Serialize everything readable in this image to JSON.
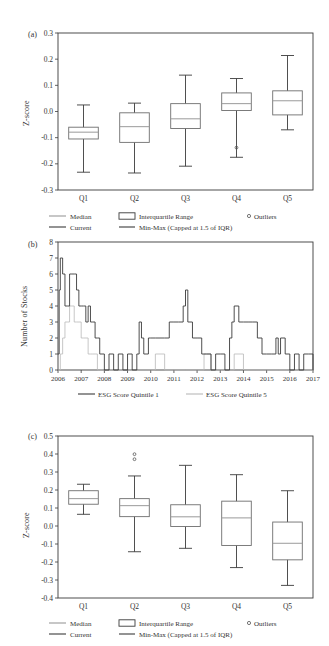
{
  "figure": {
    "panels": [
      "(a)",
      "(b)",
      "(c)"
    ]
  },
  "panel_a": {
    "label": "(a)",
    "ylabel": "Z-score",
    "yticks": [
      "0.3",
      "0.2",
      "0.1",
      "0.0",
      "-0.1",
      "-0.2",
      "-0.3"
    ],
    "xticks": [
      "Q1",
      "Q2",
      "Q3",
      "Q4",
      "Q5"
    ]
  },
  "panel_b": {
    "label": "(b)",
    "ylabel": "Number of Stocks",
    "yticks": [
      "8",
      "7",
      "6",
      "5",
      "4",
      "3",
      "2",
      "1",
      "0"
    ],
    "xticks": [
      "2006",
      "2007",
      "2008",
      "2009",
      "2010",
      "2011",
      "2012",
      "2013",
      "2014",
      "2015",
      "2016",
      "2017"
    ]
  },
  "panel_c": {
    "label": "(c)",
    "ylabel": "Z-score",
    "yticks": [
      "0.5",
      "0.4",
      "0.3",
      "0.2",
      "0.1",
      "0.0",
      "-0.1",
      "-0.2",
      "-0.3",
      "-0.4"
    ],
    "xticks": [
      "Q1",
      "Q2",
      "Q3",
      "Q4",
      "Q5"
    ]
  },
  "box_legend": {
    "median": "Median",
    "iqr": "Interquartile Range",
    "outliers": "Outliers",
    "current": "Current",
    "minmax": "Min-Max (Capped at 1.5 of IQR)"
  },
  "line_legend": {
    "series1": "ESG Score Quintile 1",
    "series2": "ESG Score Quintile 5"
  },
  "colors": {
    "median": "#9a9a9a",
    "current": "#3b3b3b",
    "box": "#6e6e6e",
    "whisker": "#3b3b3b",
    "outlier": "#555555",
    "q1_series": "#b9b9b9",
    "q5_series": "#3b3b3b"
  },
  "chart_data": [
    {
      "type": "box",
      "panel": "(a)",
      "title": "",
      "xlabel": "",
      "ylabel": "Z-score",
      "ylim": [
        -0.3,
        0.3
      ],
      "ytick_values": [
        0.3,
        0.2,
        0.1,
        0.0,
        -0.1,
        -0.2,
        -0.3
      ],
      "grid": false,
      "categories": [
        "Q1",
        "Q2",
        "Q3",
        "Q4",
        "Q5"
      ],
      "boxes": [
        {
          "category": "Q1",
          "min": -0.232,
          "q1": -0.105,
          "median": -0.079,
          "q3": -0.06,
          "max": 0.025,
          "outliers": []
        },
        {
          "category": "Q2",
          "min": -0.235,
          "q1": -0.118,
          "median": -0.058,
          "q3": -0.005,
          "max": 0.032,
          "outliers": []
        },
        {
          "category": "Q3",
          "min": -0.209,
          "q1": -0.065,
          "median": -0.028,
          "q3": 0.03,
          "max": 0.139,
          "outliers": []
        },
        {
          "category": "Q4",
          "min": -0.175,
          "q1": 0.004,
          "median": 0.03,
          "q3": 0.071,
          "max": 0.126,
          "outliers": [
            -0.138
          ]
        },
        {
          "category": "Q5",
          "min": -0.07,
          "q1": -0.013,
          "median": 0.041,
          "q3": 0.079,
          "max": 0.214,
          "outliers": []
        }
      ]
    },
    {
      "type": "line",
      "panel": "(b)",
      "title": "",
      "xlabel": "",
      "ylabel": "Number of Stocks",
      "ylim": [
        0,
        8
      ],
      "ytick_values": [
        0,
        1,
        2,
        3,
        4,
        5,
        6,
        7,
        8
      ],
      "xlim": [
        2006,
        2017
      ],
      "xtick_values": [
        2006,
        2007,
        2008,
        2009,
        2010,
        2011,
        2012,
        2013,
        2014,
        2015,
        2016,
        2017
      ],
      "grid": false,
      "legend_position": "bottom",
      "series": [
        {
          "name": "ESG Score Quintile 1",
          "color": "#b9b9b9",
          "x": [
            2006.0,
            2006.1,
            2006.2,
            2006.3,
            2006.4,
            2006.5,
            2006.6,
            2006.7,
            2006.8,
            2006.9,
            2007.0,
            2007.1,
            2007.2,
            2007.3,
            2007.4,
            2007.5,
            2007.6,
            2007.7,
            2007.8,
            2007.9,
            2008.2,
            2008.6,
            2009.0,
            2009.5,
            2010.0,
            2010.2,
            2010.4,
            2010.6,
            2011.0,
            2011.5,
            2012.0,
            2012.3,
            2012.6,
            2013.0,
            2013.3,
            2013.6,
            2014.0,
            2014.5,
            2015.0,
            2015.5,
            2016.0,
            2016.5,
            2017.0
          ],
          "values": [
            0,
            1,
            2,
            3,
            3,
            4,
            4,
            3,
            3,
            3,
            2,
            2,
            2,
            1,
            1,
            1,
            1,
            0,
            0,
            0,
            0,
            0,
            0,
            0,
            0,
            1,
            1,
            0,
            0,
            0,
            0,
            1,
            0,
            0,
            0,
            1,
            0,
            0,
            0,
            0,
            0,
            0,
            0
          ]
        },
        {
          "name": "ESG Score Quintile 5",
          "color": "#3b3b3b",
          "x": [
            2006.0,
            2006.05,
            2006.1,
            2006.2,
            2006.3,
            2006.4,
            2006.5,
            2006.6,
            2006.7,
            2006.8,
            2006.9,
            2007.0,
            2007.1,
            2007.2,
            2007.3,
            2007.4,
            2007.5,
            2007.6,
            2007.7,
            2007.8,
            2007.9,
            2008.0,
            2008.2,
            2008.4,
            2008.6,
            2008.8,
            2009.0,
            2009.2,
            2009.4,
            2009.5,
            2009.6,
            2009.7,
            2009.8,
            2009.9,
            2010.0,
            2010.2,
            2010.4,
            2010.6,
            2010.8,
            2011.0,
            2011.2,
            2011.4,
            2011.5,
            2011.6,
            2011.8,
            2012.0,
            2012.2,
            2012.4,
            2012.6,
            2012.8,
            2013.0,
            2013.2,
            2013.4,
            2013.5,
            2013.6,
            2013.8,
            2014.0,
            2014.2,
            2014.4,
            2014.6,
            2014.8,
            2015.0,
            2015.2,
            2015.4,
            2015.5,
            2015.6,
            2015.8,
            2016.0,
            2016.2,
            2016.4,
            2016.6,
            2016.8,
            2017.0
          ],
          "values": [
            1,
            5,
            7,
            6,
            4,
            4,
            6,
            6,
            6,
            5,
            4,
            4,
            4,
            3,
            4,
            3,
            3,
            2,
            2,
            1,
            1,
            0,
            1,
            0,
            1,
            0,
            1,
            0,
            1,
            3,
            2,
            1,
            1,
            2,
            2,
            2,
            2,
            2,
            3,
            3,
            3,
            4,
            5,
            3,
            2,
            2,
            1,
            1,
            0,
            1,
            1,
            0,
            2,
            3,
            4,
            3,
            3,
            3,
            3,
            2,
            1,
            1,
            1,
            2,
            1,
            2,
            1,
            0,
            1,
            0,
            1,
            1,
            0
          ]
        }
      ]
    },
    {
      "type": "box",
      "panel": "(c)",
      "title": "",
      "xlabel": "",
      "ylabel": "Z-score",
      "ylim": [
        -0.4,
        0.5
      ],
      "ytick_values": [
        0.5,
        0.4,
        0.3,
        0.2,
        0.1,
        0.0,
        -0.1,
        -0.2,
        -0.3,
        -0.4
      ],
      "grid": false,
      "categories": [
        "Q1",
        "Q2",
        "Q3",
        "Q4",
        "Q5"
      ],
      "boxes": [
        {
          "category": "Q1",
          "min": 0.065,
          "q1": 0.121,
          "median": 0.152,
          "q3": 0.196,
          "max": 0.232,
          "outliers": []
        },
        {
          "category": "Q2",
          "min": -0.143,
          "q1": 0.052,
          "median": 0.113,
          "q3": 0.152,
          "max": 0.278,
          "outliers": [
            0.399,
            0.371
          ]
        },
        {
          "category": "Q3",
          "min": -0.124,
          "q1": -0.003,
          "median": 0.051,
          "q3": 0.118,
          "max": 0.337,
          "outliers": []
        },
        {
          "category": "Q4",
          "min": -0.231,
          "q1": -0.108,
          "median": 0.045,
          "q3": 0.138,
          "max": 0.285,
          "outliers": []
        },
        {
          "category": "Q5",
          "min": -0.33,
          "q1": -0.188,
          "median": -0.096,
          "q3": 0.022,
          "max": 0.196,
          "outliers": []
        }
      ]
    }
  ]
}
